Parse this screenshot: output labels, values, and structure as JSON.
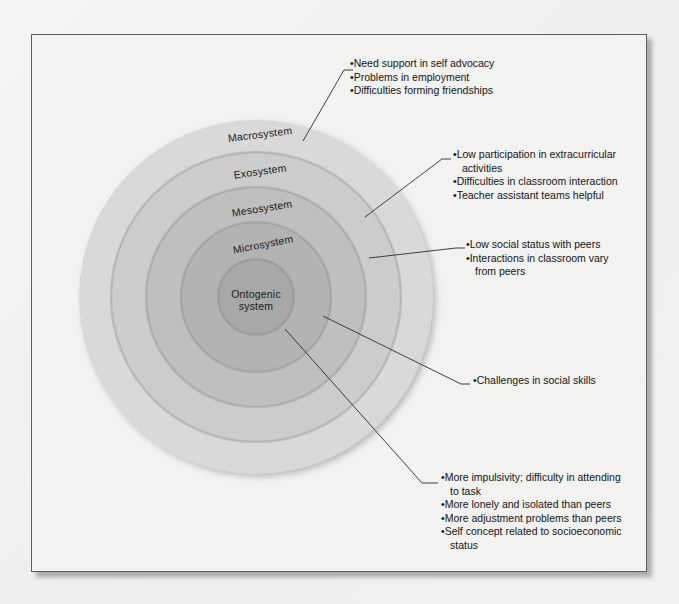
{
  "figure": {
    "background_color": "#f2f2f0",
    "frame_border_color": "#5d5d5d"
  },
  "rings": [
    {
      "id": "macrosystem",
      "label": "Macrosystem",
      "color": "#d9d9d9",
      "radius": 177,
      "label_x": 228,
      "label_y": 99
    },
    {
      "id": "exosystem",
      "label": "Exosystem",
      "color": "#cccccc",
      "radius": 145,
      "label_x": 228,
      "label_y": 136
    },
    {
      "id": "mesosystem",
      "label": "Mesosystem",
      "color": "#bfbfbf",
      "radius": 110,
      "label_x": 230,
      "label_y": 173
    },
    {
      "id": "microsystem",
      "label": "Microsystem",
      "color": "#b3b3b3",
      "radius": 75,
      "label_x": 231,
      "label_y": 209
    },
    {
      "id": "ontogenic",
      "label": "Ontogenic\nsystem",
      "color": "#a8a8a8",
      "radius": 38,
      "label_x": 224,
      "label_y": 272
    }
  ],
  "ring_core_label_line1": "Ontogenic",
  "ring_core_label_line2": "system",
  "center": {
    "x": 224,
    "y": 262
  },
  "annotations": [
    {
      "id": "macrosystem-notes",
      "x": 318,
      "y": 22,
      "items": [
        {
          "text": "Need support in self advocacy"
        },
        {
          "text": "Problems in employment"
        },
        {
          "text": "Difficulties forming friendships"
        }
      ]
    },
    {
      "id": "exosystem-notes",
      "x": 421,
      "y": 113,
      "items": [
        {
          "text": "Low participation in extracurricular",
          "continuation": "activities"
        },
        {
          "text": "Difficulties in classroom interaction"
        },
        {
          "text": "Teacher assistant teams helpful"
        }
      ]
    },
    {
      "id": "mesosystem-notes",
      "x": 434,
      "y": 203,
      "items": [
        {
          "text": "Low social status with peers"
        },
        {
          "text": "Interactions in classroom vary",
          "continuation": "from peers"
        }
      ]
    },
    {
      "id": "microsystem-notes",
      "x": 441,
      "y": 339,
      "items": [
        {
          "text": "Challenges in social skills"
        }
      ]
    },
    {
      "id": "ontogenic-notes",
      "x": 409,
      "y": 436,
      "items": [
        {
          "text": "More impulsivity; difficulty in attending",
          "continuation": "to task"
        },
        {
          "text": "More lonely and isolated than peers"
        },
        {
          "text": "More adjustment problems than peers"
        },
        {
          "text": "Self concept related to socioeconomic",
          "continuation": "status"
        }
      ]
    }
  ],
  "leader_lines": [
    {
      "id": "leader-macrosystem",
      "points": "271,106 312,35 321,35"
    },
    {
      "id": "leader-exosystem",
      "points": "333,182 410,124 419,124"
    },
    {
      "id": "leader-mesosystem",
      "points": "337,223 424,213 433,213"
    },
    {
      "id": "leader-microsystem",
      "points": "291,281 429,349 438,349"
    },
    {
      "id": "leader-ontogenic",
      "points": "253,294 390,448 406,448"
    }
  ],
  "bullet_glyph": "•"
}
